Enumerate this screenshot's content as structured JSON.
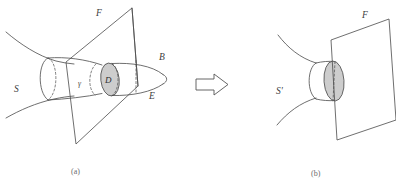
{
  "figure": {
    "panels": [
      {
        "id": "a",
        "panel_label": "(a)",
        "labels": {
          "surface": "S",
          "plane": "F",
          "boundary": "B",
          "edge": "E",
          "disk": "D",
          "curve": "γ"
        }
      },
      {
        "id": "b",
        "panel_label": "(b)",
        "labels": {
          "surface": "S'",
          "plane": "F"
        }
      }
    ],
    "arrow": {
      "name": "implies-arrow",
      "direction": "right"
    },
    "caption": "",
    "colors": {
      "stroke": "#4a4a4a",
      "disk_fill": "#c9c9c9",
      "label": "#3c3c3c",
      "panel_label": "#6b6b6b",
      "background": "#ffffff"
    }
  }
}
